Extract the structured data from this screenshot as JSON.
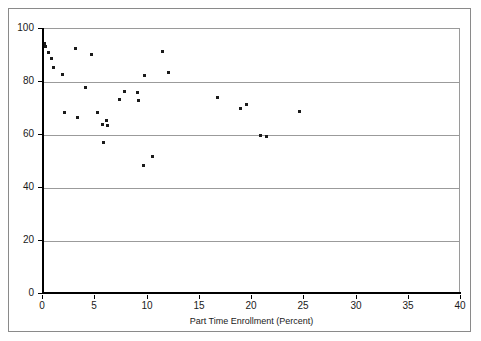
{
  "chart_data": {
    "type": "scatter",
    "title": "",
    "xlabel": "Part Time Enrollment (Percent)",
    "ylabel": "",
    "xlim": [
      0,
      40
    ],
    "ylim": [
      0,
      100
    ],
    "xticks": [
      0,
      5,
      10,
      15,
      20,
      25,
      30,
      35,
      40
    ],
    "yticks": [
      0,
      20,
      40,
      60,
      80,
      100
    ],
    "grid": "horizontal",
    "legend": null,
    "marker_color": "#1b1b1b",
    "gridline_color": "#9b9b9b",
    "axis_color": "#000000",
    "frame_color": "#8a8a8a",
    "points": [
      {
        "x": 0.2,
        "y": 94.5
      },
      {
        "x": 0.3,
        "y": 93.5
      },
      {
        "x": 0.6,
        "y": 91.0
      },
      {
        "x": 0.9,
        "y": 89.0
      },
      {
        "x": 1.1,
        "y": 85.5
      },
      {
        "x": 2.0,
        "y": 83.0
      },
      {
        "x": 3.2,
        "y": 92.5
      },
      {
        "x": 4.7,
        "y": 90.5
      },
      {
        "x": 4.2,
        "y": 78.0
      },
      {
        "x": 2.2,
        "y": 68.5
      },
      {
        "x": 3.4,
        "y": 66.5
      },
      {
        "x": 5.3,
        "y": 68.5
      },
      {
        "x": 5.8,
        "y": 64.0
      },
      {
        "x": 6.2,
        "y": 65.5
      },
      {
        "x": 6.3,
        "y": 63.5
      },
      {
        "x": 5.9,
        "y": 57.0
      },
      {
        "x": 7.4,
        "y": 73.5
      },
      {
        "x": 7.9,
        "y": 76.5
      },
      {
        "x": 9.1,
        "y": 76.0
      },
      {
        "x": 9.2,
        "y": 73.0
      },
      {
        "x": 9.8,
        "y": 82.5
      },
      {
        "x": 9.7,
        "y": 48.5
      },
      {
        "x": 10.6,
        "y": 52.0
      },
      {
        "x": 11.5,
        "y": 91.5
      },
      {
        "x": 12.1,
        "y": 83.5
      },
      {
        "x": 16.8,
        "y": 74.0
      },
      {
        "x": 19.0,
        "y": 70.0
      },
      {
        "x": 19.6,
        "y": 71.5
      },
      {
        "x": 20.9,
        "y": 60.0
      },
      {
        "x": 21.5,
        "y": 59.5
      },
      {
        "x": 24.6,
        "y": 69.0
      }
    ]
  }
}
